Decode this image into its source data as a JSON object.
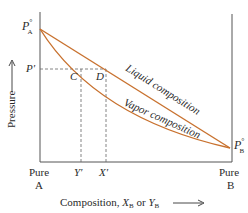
{
  "diagram": {
    "type": "pressure-composition phase diagram (ideal binary solution)",
    "colors": {
      "curve": "#c8712e",
      "axis": "#555555",
      "dashed": "#666666",
      "text": "#2a2a2a"
    },
    "y_axis": {
      "label": "Pressure",
      "arrow": "up"
    },
    "x_axis": {
      "label_prefix": "Composition, ",
      "label_x": "X",
      "label_x_sub": "B",
      "label_or": " or ",
      "label_y": "Y",
      "label_y_sub": "B",
      "arrow": "right"
    },
    "endpoints": {
      "left": {
        "line1": "Pure",
        "line2": "A",
        "pressure_label": "P",
        "pressure_sup": "°",
        "pressure_sub": "A"
      },
      "right": {
        "line1": "Pure",
        "line2": "B",
        "pressure_label": "P",
        "pressure_sup": "°",
        "pressure_sub": "B"
      }
    },
    "pressure_mark": {
      "label": "P′"
    },
    "points": {
      "C": "C",
      "D": "D"
    },
    "composition_marks": {
      "y_prime": "Y′",
      "x_prime": "X′"
    },
    "curves": [
      {
        "name": "liquid",
        "label": "Liquid composition",
        "shape": "straight line"
      },
      {
        "name": "vapor",
        "label": "Vapor composition",
        "shape": "curve below liquid line"
      }
    ]
  }
}
